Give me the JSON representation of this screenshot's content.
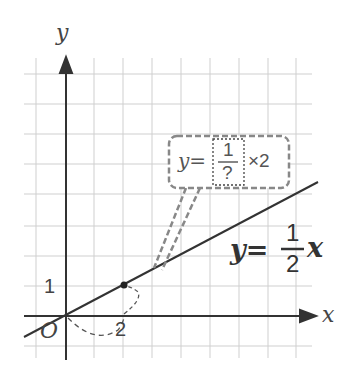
{
  "axes": {
    "x_label": "x",
    "y_label": "y",
    "origin_label": "O",
    "tick_x": "2",
    "tick_y": "1"
  },
  "line": {
    "equation_lhs": "y=",
    "numerator": "1",
    "denominator": "2",
    "variable": "x",
    "slope": 0.5,
    "color": "#333333"
  },
  "callout": {
    "lhs": "y=",
    "numerator": "1",
    "denominator": "?",
    "multiplier": "×2",
    "border_color": "#888888"
  },
  "points": [
    {
      "x": 2,
      "y": 1,
      "label": "(2,1)"
    }
  ],
  "grid": {
    "color": "#cccccc",
    "unit_px": 29
  }
}
